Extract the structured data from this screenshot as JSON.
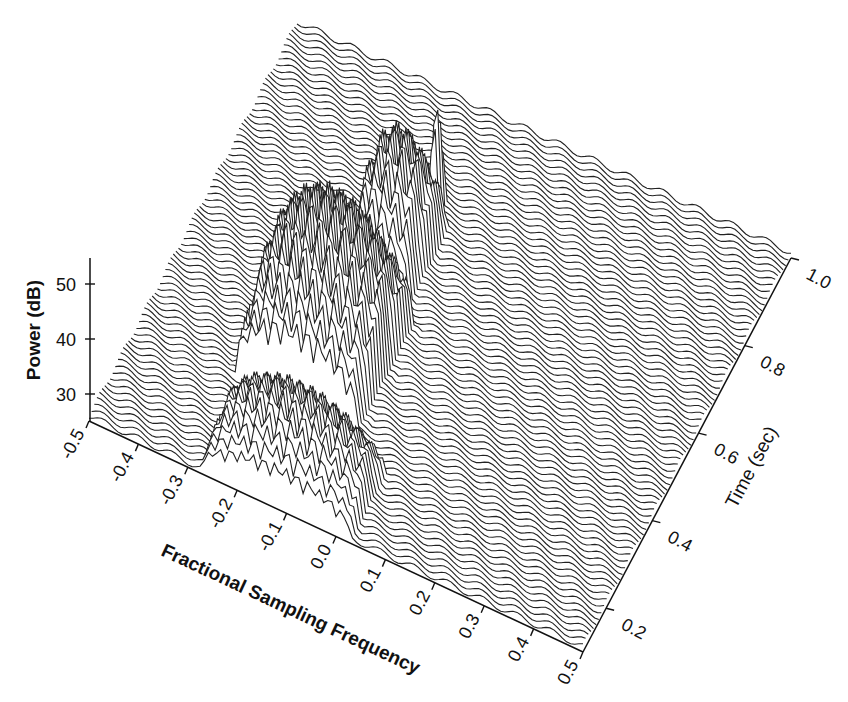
{
  "chart_data": {
    "type": "waterfall-3d",
    "title": "",
    "x_axis": {
      "label": "Fractional Sampling Frequency",
      "range": [
        -0.5,
        0.5
      ],
      "ticks": [
        "-0.5",
        "-0.4",
        "-0.3",
        "-0.2",
        "-0.1",
        "0.0",
        "0.1",
        "0.2",
        "0.3",
        "0.4",
        "0.5"
      ]
    },
    "y_axis": {
      "label": "Time (sec)",
      "range": [
        0.1,
        1.0
      ],
      "ticks": [
        "0.2",
        "0.4",
        "0.6",
        "0.8",
        "1.0"
      ]
    },
    "z_axis": {
      "label": "Power (dB)",
      "range": [
        25,
        55
      ],
      "ticks": [
        "30",
        "40",
        "50"
      ]
    },
    "n_traces": 80,
    "noise_floor_db": 26,
    "features": [
      {
        "description": "Broad multi-peak spectral burst, early time",
        "time_range": [
          0.1,
          0.25
        ],
        "freq_range": [
          -0.27,
          0.03
        ],
        "peak_db": 42
      },
      {
        "description": "Wide high-power burst with many peaks",
        "time_range": [
          0.3,
          0.55
        ],
        "freq_range": [
          -0.3,
          -0.05
        ],
        "peak_db": 55
      },
      {
        "description": "Narrowing chirp-like ridge drifting to higher frequency",
        "time_range": [
          0.55,
          0.75
        ],
        "freq_range": [
          -0.2,
          -0.08
        ],
        "peak_db": 50
      },
      {
        "description": "Single narrow peak",
        "time_range": [
          0.75,
          0.8
        ],
        "freq_range": [
          -0.12,
          -0.1
        ],
        "peak_db": 47
      }
    ],
    "grid": false,
    "legend": null
  },
  "labels": {
    "power": "Power (dB)",
    "frequency": "Fractional Sampling Frequency",
    "time": "Time (sec)"
  }
}
